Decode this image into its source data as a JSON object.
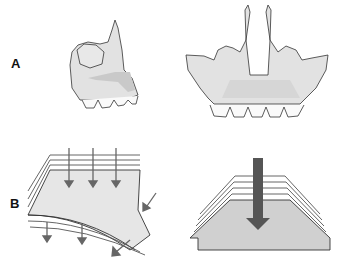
{
  "panels": [
    {
      "label": "A",
      "description": "Maxilla bone, lateral and frontal views with teeth"
    },
    {
      "label": "B",
      "description": "Layered sheets under force: curved bending (left) and stacked plates with central downward arrow (right)"
    }
  ],
  "colors": {
    "bone_fill": "#e2e2e2",
    "highlight_fill": "#c9c9c9",
    "outline": "#333333",
    "arrow_dark": "#555555",
    "plate_fill": "#d0d0d0"
  }
}
